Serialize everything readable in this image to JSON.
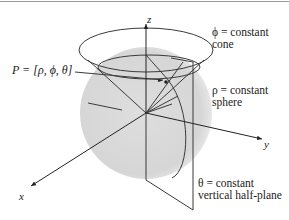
{
  "figure": {
    "border_top_color": "#9a9a9a",
    "sphere_fill": "#d6d6d6",
    "line_color": "#3a3a3a",
    "axes": {
      "z": "z",
      "y": "y",
      "x": "x"
    },
    "point_label": "P = [ρ, ϕ, θ]",
    "annotations": {
      "cone": {
        "line1": "ϕ = constant",
        "line2": "cone"
      },
      "sphere": {
        "line1": "ρ = constant",
        "line2": "sphere"
      },
      "half_plane": {
        "line1": "θ = constant",
        "line2": "vertical half-plane"
      }
    }
  }
}
